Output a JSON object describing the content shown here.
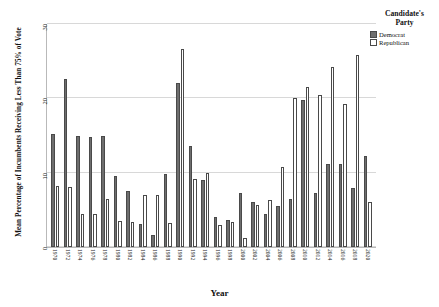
{
  "legend": {
    "title_line1": "Candidate's",
    "title_line2": "Party",
    "entries": [
      {
        "label": "Democrat",
        "key": "dem",
        "color": "#6e6e6e"
      },
      {
        "label": "Republican",
        "key": "rep",
        "color": "#ffffff"
      }
    ]
  },
  "chart_data": {
    "type": "bar",
    "title": "",
    "subtitle": "",
    "xlabel": "Year",
    "ylabel": "Mean Percentage of Incumbents Receiving Less Than 75% of Vote",
    "ylim": [
      0,
      30
    ],
    "yticks": [
      0,
      10,
      20,
      30
    ],
    "ytick_labels": [
      "0",
      "10",
      "20",
      "30"
    ],
    "grid": true,
    "grid_axis": "y",
    "legend_position": "right",
    "orientation": "vertical",
    "grouping": "clustered",
    "categories": [
      "1970",
      "1972",
      "1974",
      "1976",
      "1978",
      "1980",
      "1982",
      "1984",
      "1986",
      "1988",
      "1990",
      "1992",
      "1994",
      "1996",
      "1998",
      "2000",
      "2002",
      "2004",
      "2006",
      "2008",
      "2010",
      "2012",
      "2014",
      "2016",
      "2018",
      "2020"
    ],
    "series": [
      {
        "name": "Democrat",
        "color": "#6e6e6e",
        "values": [
          15.2,
          22.6,
          14.9,
          14.8,
          14.9,
          9.6,
          7.5,
          3.1,
          1.6,
          9.8,
          22.0,
          13.6,
          9.0,
          4.0,
          3.6,
          7.3,
          6.0,
          4.4,
          5.5,
          6.5,
          19.8,
          7.2,
          11.2,
          11.2,
          8.0,
          12.3
        ]
      },
      {
        "name": "Republican",
        "color": "#ffffff",
        "values": [
          8.2,
          8.1,
          4.4,
          4.4,
          6.4,
          3.5,
          3.4,
          7.0,
          7.0,
          3.2,
          26.7,
          9.2,
          9.9,
          3.0,
          3.3,
          1.2,
          5.6,
          6.3,
          10.8,
          20.0,
          21.5,
          20.5,
          24.2,
          19.2,
          25.8,
          6.0
        ]
      }
    ]
  }
}
